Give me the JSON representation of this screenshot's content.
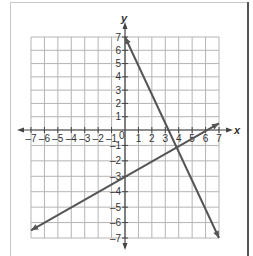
{
  "chart_data": {
    "type": "line",
    "title": "",
    "xlabel": "x",
    "ylabel": "y",
    "xlim": [
      -7,
      7
    ],
    "ylim": [
      -7,
      7
    ],
    "grid": true,
    "x_ticks": [
      -7,
      -6,
      -5,
      -4,
      -3,
      -2,
      -1,
      0,
      1,
      2,
      3,
      4,
      5,
      6,
      7
    ],
    "x_tick_labels": [
      "-7",
      "-6",
      "-5",
      "-4",
      "-3",
      "-2",
      "-1",
      "0",
      "1",
      "2",
      "3",
      "4",
      "5",
      "6",
      "7"
    ],
    "y_tick_labels": [
      "7",
      "6",
      "5",
      "4",
      "3",
      "2",
      "1",
      "-1",
      "-2",
      "-3",
      "-4",
      "-5",
      "-6",
      "-7"
    ],
    "series": [
      {
        "name": "line-1",
        "equation": "y = -2x + 7",
        "points": [
          [
            0,
            7
          ],
          [
            4,
            -1
          ],
          [
            7,
            -7
          ]
        ],
        "color": "#555555"
      },
      {
        "name": "line-2",
        "equation": "y = 0.5x - 3",
        "points": [
          [
            -7,
            -6.5
          ],
          [
            0,
            -3
          ],
          [
            4,
            -1
          ],
          [
            7,
            0.5
          ]
        ],
        "color": "#555555"
      }
    ],
    "intersection": [
      4,
      -1
    ]
  },
  "labels": {
    "x_axis": "x",
    "y_axis": "y",
    "origin": "0"
  }
}
